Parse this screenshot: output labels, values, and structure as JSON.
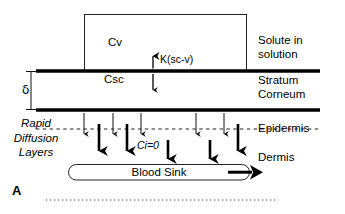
{
  "figure": {
    "panel_letter": "A"
  },
  "region_labels": {
    "solute": "Solute in\nsolution",
    "stratum_corneum": "Stratum\nCorneum",
    "epidermis": "Epidermis",
    "dermis": "Dermis",
    "rapid_diffusion": "Rapid\nDiffusion\nLayers"
  },
  "concentrations": {
    "vehicle": "Cv",
    "stratum_corneum": "Csc",
    "interface": "Ci=0"
  },
  "parameters": {
    "partition_coefficient": "K(sc-v)",
    "thickness": "δ"
  },
  "blood_sink": {
    "label": "Blood Sink"
  },
  "colors": {
    "ink": "#000000",
    "background": "#ffffff",
    "thick_line": "#000000",
    "thin_line": "#1a1a1a"
  },
  "icons": {
    "partition_arrow": "double-headed-vertical-arrow",
    "flux_arrow": "down-arrow",
    "blood_flow_arrow": "right-arrow"
  },
  "geometry": {
    "vehicle_box": {
      "x": 84,
      "y": 14,
      "width": 163,
      "height": 57
    },
    "stratum_corneum_top_y": 71,
    "stratum_corneum_bottom_y": 110,
    "epidermis_dashed_y": 129,
    "blood_sink_capsule": {
      "x": 68,
      "y": 164,
      "width": 182,
      "height": 16
    },
    "bottom_dotted_y": 200,
    "thin_flux_arrows_x": [
      84,
      113,
      141,
      196,
      224
    ],
    "thick_flux_arrows_x": [
      99,
      127,
      168,
      210,
      238
    ]
  }
}
